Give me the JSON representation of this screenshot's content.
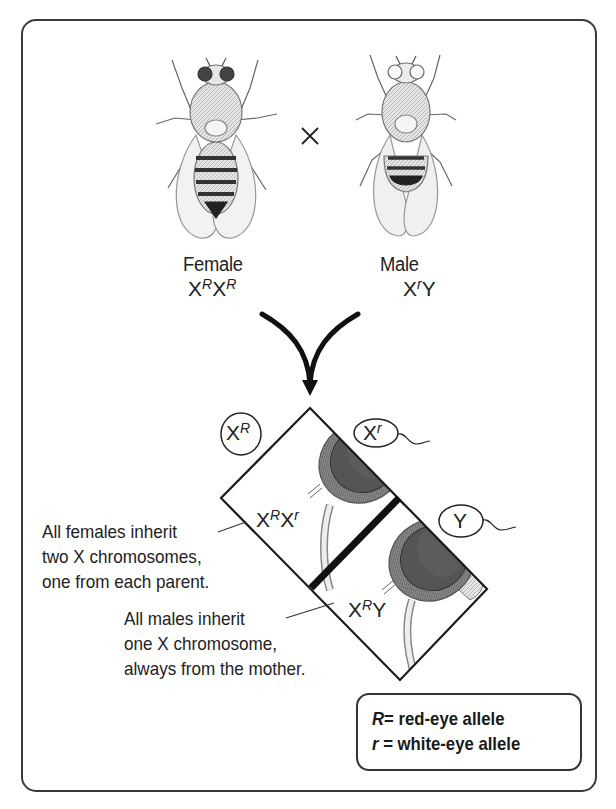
{
  "parents": {
    "cross_symbol": "×",
    "female": {
      "label": "Female",
      "genotype": {
        "a": "X",
        "a_sup": "R",
        "b": "X",
        "b_sup": "R"
      },
      "eye_color": "red"
    },
    "male": {
      "label": "Male",
      "genotype": {
        "a": "X",
        "a_sup": "r",
        "b": "Y"
      },
      "eye_color": "white"
    }
  },
  "punnett": {
    "egg": {
      "base": "X",
      "sup": "R"
    },
    "sperm": [
      {
        "base": "X",
        "sup": "r"
      },
      {
        "base": "Y",
        "sup": ""
      }
    ],
    "offspring": [
      {
        "base1": "X",
        "sup1": "R",
        "base2": "X",
        "sup2": "r",
        "sex": "female"
      },
      {
        "base1": "X",
        "sup1": "R",
        "base2": "Y",
        "sup2": "",
        "sex": "male"
      }
    ]
  },
  "notes": {
    "females": [
      "All females inherit",
      "two X chromosomes,",
      "one from each parent."
    ],
    "males": [
      "All males inherit",
      "one X chromosome,",
      "always from the mother."
    ]
  },
  "legend": {
    "items": [
      {
        "symbol": "R",
        "text": "= red-eye allele"
      },
      {
        "symbol": "r",
        "text": " = white-eye allele"
      }
    ]
  },
  "colors": {
    "line": "#222222",
    "red_eye": "#4a4a4a",
    "white_eye": "#f2f2f2",
    "body": "#d8d8d8"
  }
}
